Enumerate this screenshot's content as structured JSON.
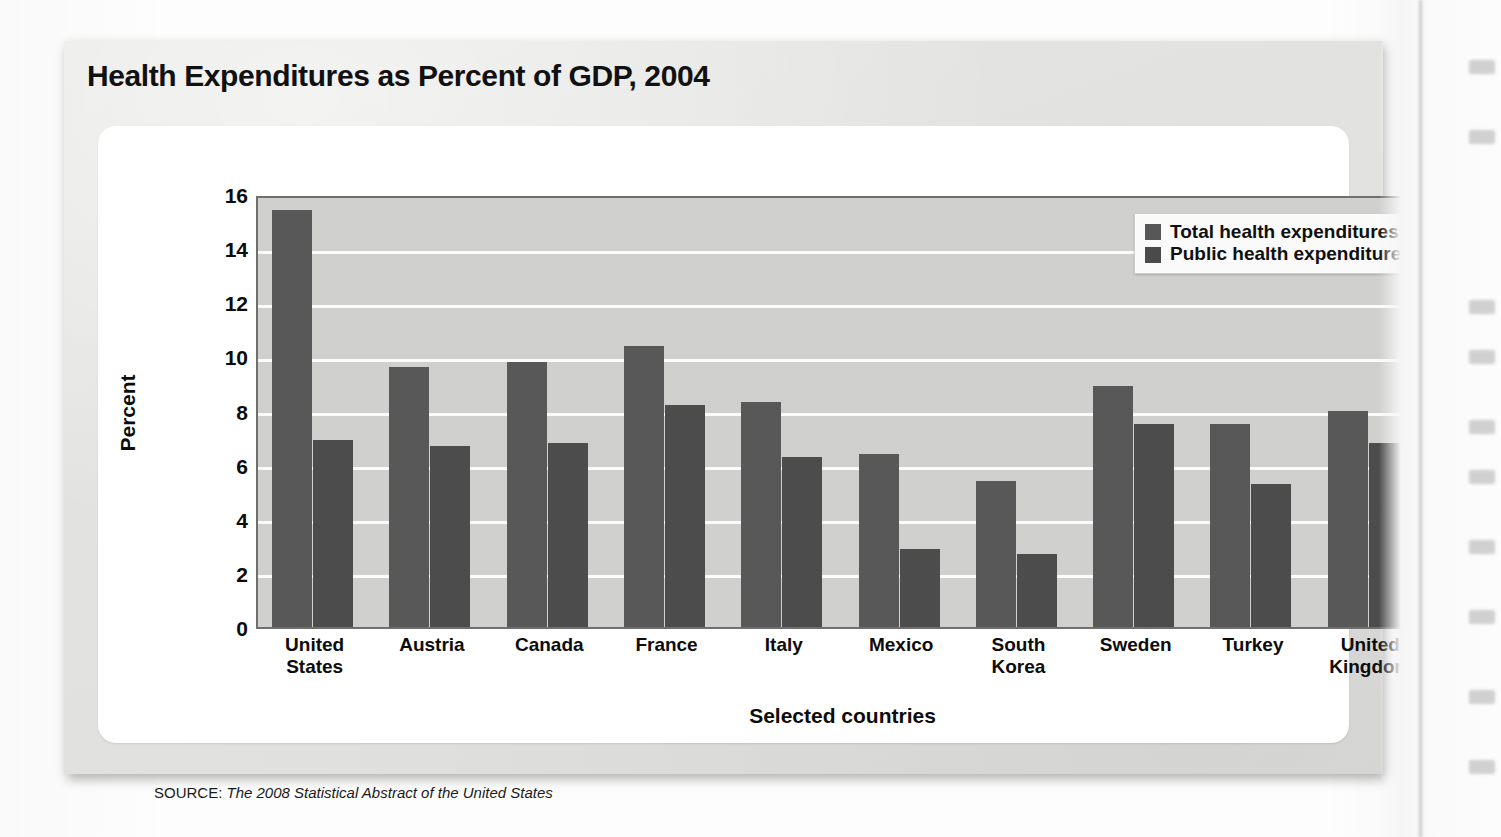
{
  "figure": {
    "title": "Health Expenditures as Percent of GDP, 2004",
    "source_label": "SOURCE:",
    "source_text": "The 2008 Statistical Abstract of the United States"
  },
  "legend": {
    "position": "top-right",
    "items": [
      {
        "label": "Total health expenditures",
        "color": "#575757"
      },
      {
        "label": "Public health expenditures",
        "color": "#4a4a4a"
      }
    ]
  },
  "axes": {
    "y_title": "Percent",
    "x_title": "Selected countries",
    "y_ticks": [
      "16",
      "14",
      "12",
      "10",
      "8",
      "6",
      "4",
      "2",
      "0"
    ]
  },
  "chart_data": {
    "type": "bar",
    "title": "Health Expenditures as Percent of GDP, 2004",
    "xlabel": "Selected countries",
    "ylabel": "Percent",
    "ylim": [
      0,
      16
    ],
    "ytick_step": 2,
    "grid": true,
    "legend_position": "top-right",
    "categories": [
      "United States",
      "Austria",
      "Canada",
      "France",
      "Italy",
      "Mexico",
      "South Korea",
      "Sweden",
      "Turkey",
      "United Kingdom"
    ],
    "category_lines": [
      [
        "United",
        "States"
      ],
      [
        "Austria"
      ],
      [
        "Canada"
      ],
      [
        "France"
      ],
      [
        "Italy"
      ],
      [
        "Mexico"
      ],
      [
        "South",
        "Korea"
      ],
      [
        "Sweden"
      ],
      [
        "Turkey"
      ],
      [
        "United",
        "Kingdom"
      ]
    ],
    "series": [
      {
        "name": "Total health expenditures",
        "color": "#575757",
        "values": [
          15.4,
          9.6,
          9.8,
          10.4,
          8.3,
          6.4,
          5.4,
          8.9,
          7.5,
          8.0
        ]
      },
      {
        "name": "Public health expenditures",
        "color": "#4a4a4a",
        "values": [
          6.9,
          6.7,
          6.8,
          8.2,
          6.3,
          2.9,
          2.7,
          7.5,
          5.3,
          6.8
        ]
      }
    ]
  }
}
